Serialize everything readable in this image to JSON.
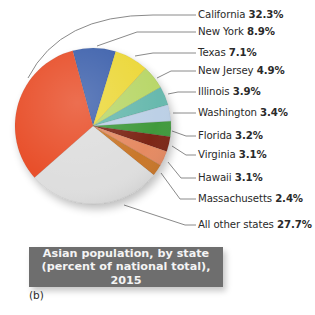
{
  "chart_data": {
    "type": "pie",
    "title": "Asian population, by state (percent of national total), 2015",
    "title_lines": [
      "Asian population, by state",
      "(percent of national total), 2015"
    ],
    "panel_label": "(b)",
    "unit": "%",
    "start_angle_deg": -15.1,
    "direction": "clockwise",
    "slices": [
      {
        "name": "New York",
        "value": 8.9,
        "label": "8.9%",
        "color": "#3f63ad"
      },
      {
        "name": "Texas",
        "value": 7.1,
        "label": "7.1%",
        "color": "#ecd83a"
      },
      {
        "name": "New Jersey",
        "value": 4.9,
        "label": "4.9%",
        "color": "#b9d76a"
      },
      {
        "name": "Illinois",
        "value": 3.9,
        "label": "3.9%",
        "color": "#68b9ae"
      },
      {
        "name": "Washington",
        "value": 3.4,
        "label": "3.4%",
        "color": "#bcd0e6"
      },
      {
        "name": "Florida",
        "value": 3.2,
        "label": "3.2%",
        "color": "#3f9a3d"
      },
      {
        "name": "Virginia",
        "value": 3.1,
        "label": "3.1%",
        "color": "#7c2618"
      },
      {
        "name": "Hawaii",
        "value": 3.1,
        "label": "3.1%",
        "color": "#e58a62"
      },
      {
        "name": "Massachusetts",
        "value": 2.4,
        "label": "2.4%",
        "color": "#c9772c"
      },
      {
        "name": "All other states",
        "value": 27.7,
        "label": "27.7%",
        "color": "#dedede"
      },
      {
        "name": "California",
        "value": 32.3,
        "label": "32.3%",
        "color": "#e8502b"
      }
    ],
    "legend_order": [
      "California",
      "New York",
      "Texas",
      "New Jersey",
      "Illinois",
      "Washington",
      "Florida",
      "Virginia",
      "Hawaii",
      "Massachusetts",
      "All other states"
    ],
    "legend_position": "right, with leader lines"
  },
  "labels": [
    {
      "name": "California",
      "value": "32.3%",
      "y": 15
    },
    {
      "name": "New York",
      "value": "8.9%",
      "y": 32
    },
    {
      "name": "Texas",
      "value": "7.1%",
      "y": 53
    },
    {
      "name": "New Jersey",
      "value": "4.9%",
      "y": 71
    },
    {
      "name": "Illinois",
      "value": "3.9%",
      "y": 92
    },
    {
      "name": "Washington",
      "value": "3.4%",
      "y": 113
    },
    {
      "name": "Florida",
      "value": "3.2%",
      "y": 136
    },
    {
      "name": "Virginia",
      "value": "3.1%",
      "y": 155
    },
    {
      "name": "Hawaii",
      "value": "3.1%",
      "y": 178
    },
    {
      "name": "Massachusetts",
      "value": "2.4%",
      "y": 199
    },
    {
      "name": "All other states",
      "value": "27.7%",
      "y": 225
    }
  ],
  "leader_lines": [
    "M 28 78 Q 60 15 153 15 L 196 15",
    "M 97 46 L 137 32 L 196 32",
    "M 135 56 L 153 53 L 196 53",
    "M 157 78 L 171 71 L 196 71",
    "M 168 94 L 178 92 L 196 92",
    "M 173 113 L 196 113",
    "M 172 131 L 186 136 L 196 136",
    "M 172 146 L 186 155 L 196 155",
    "M 168 162 L 181 178 L 196 178",
    "M 161 173 L 180 199 L 196 199",
    "M 124 205 L 185 225 L 196 225"
  ],
  "pie_geometry": {
    "cx": 93,
    "cy": 126,
    "r": 78
  }
}
